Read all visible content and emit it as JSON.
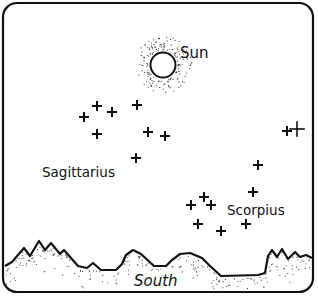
{
  "diagram": {
    "labels": {
      "sun": "Sun",
      "sagittarius": "Sagittarius",
      "scorpius": "Scorpius",
      "direction": "South"
    },
    "sun": {
      "cx": 163,
      "cy": 65,
      "r": 13
    },
    "constellations": [
      {
        "name": "Sagittarius",
        "stars": [
          [
            84,
            117
          ],
          [
            97,
            106
          ],
          [
            112,
            112
          ],
          [
            137,
            105
          ],
          [
            97,
            134
          ],
          [
            148,
            132
          ],
          [
            165,
            136
          ],
          [
            136,
            158
          ]
        ]
      },
      {
        "name": "Scorpius",
        "stars": [
          [
            287,
            131
          ],
          [
            297,
            129,
            "large"
          ],
          [
            258,
            165
          ],
          [
            253,
            192
          ],
          [
            204,
            197
          ],
          [
            191,
            205
          ],
          [
            211,
            205
          ],
          [
            198,
            224
          ],
          [
            221,
            231
          ],
          [
            246,
            224
          ]
        ]
      }
    ],
    "colors": {
      "ink": "#111111",
      "background": "#ffffff"
    }
  }
}
